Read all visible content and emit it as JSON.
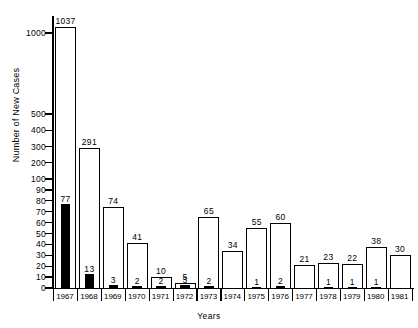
{
  "chart_data": {
    "type": "bar",
    "title": "",
    "xlabel": "Years",
    "ylabel": "Number of New Cases",
    "categories": [
      "1967",
      "1968",
      "1969",
      "1970",
      "1971",
      "1972",
      "1973",
      "1974",
      "1975",
      "1976",
      "1977",
      "1978",
      "1979",
      "1980",
      "1981"
    ],
    "series": [
      {
        "name": "Total new cases",
        "style": "open-white-bar",
        "values": [
          1037,
          291,
          74,
          41,
          10,
          5,
          65,
          34,
          55,
          60,
          21,
          23,
          22,
          38,
          30
        ]
      },
      {
        "name": "Subset (filled)",
        "style": "solid-black-bar",
        "values": [
          77,
          13,
          3,
          2,
          2,
          3,
          2,
          null,
          1,
          2,
          null,
          1,
          1,
          1,
          null
        ]
      }
    ],
    "ytick_labels": [
      "1000",
      "500",
      "400",
      "300",
      "200",
      "100",
      "90",
      "80",
      "70",
      "60",
      "50",
      "40",
      "30",
      "20",
      "10",
      "0"
    ],
    "ytick_values": [
      1000,
      500,
      400,
      300,
      200,
      100,
      90,
      80,
      70,
      60,
      50,
      40,
      30,
      20,
      10,
      0
    ],
    "ylim": [
      0,
      1100
    ],
    "yscale": "broken-compressed",
    "grid": false,
    "legend": "none"
  },
  "axes": {
    "y_title": "Number of New Cases",
    "x_title": "Years"
  }
}
